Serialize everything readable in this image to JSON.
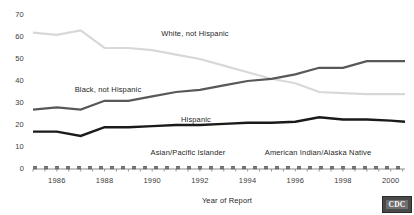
{
  "chart_data": {
    "type": "line",
    "title": "",
    "xlabel": "Year of Report",
    "ylabel": "",
    "xlim": [
      1985,
      2000.6
    ],
    "ylim": [
      0,
      70
    ],
    "grid": false,
    "legend_position": "inline-annotations",
    "x": [
      1985,
      1986,
      1987,
      1988,
      1989,
      1990,
      1991,
      1992,
      1993,
      1994,
      1995,
      1996,
      1997,
      1998,
      1999,
      2000,
      2000.6
    ],
    "x_tick_labels": [
      "1986",
      "1988",
      "1990",
      "1992",
      "1994",
      "1996",
      "1998",
      "2000"
    ],
    "x_tick_values": [
      1986,
      1988,
      1990,
      1992,
      1994,
      1996,
      1998,
      2000
    ],
    "y_tick_labels": [
      "0",
      "10",
      "20",
      "30",
      "40",
      "50",
      "60",
      "70"
    ],
    "y_tick_values": [
      0,
      10,
      20,
      30,
      40,
      50,
      60,
      70
    ],
    "series": [
      {
        "name": "White, not Hispanic",
        "color": "#d8d8d8",
        "style": "solid",
        "width": 2.2,
        "values": [
          62,
          61,
          63,
          55,
          55,
          54,
          52,
          50,
          47,
          44,
          41,
          39,
          35,
          34.5,
          34,
          34,
          34
        ]
      },
      {
        "name": "Black, not Hispanic",
        "color": "#585858",
        "style": "solid",
        "width": 2.2,
        "values": [
          27,
          28,
          27,
          31,
          31,
          33,
          35,
          36,
          38,
          40,
          41,
          43,
          46,
          46,
          49,
          49,
          49
        ]
      },
      {
        "name": "Hispanic",
        "color": "#1a1a1a",
        "style": "solid",
        "width": 2.4,
        "values": [
          17,
          17,
          15,
          19,
          19,
          19.5,
          20,
          20,
          20.5,
          21,
          21,
          21.5,
          23.5,
          22.5,
          22.5,
          22,
          21.5
        ]
      },
      {
        "name": "Asian/Pacific Islander",
        "color": "#6a6a6a",
        "style": "dashed",
        "width": 1.8,
        "values": [
          1,
          1,
          1,
          1,
          1,
          1,
          1,
          1,
          1,
          1,
          1,
          1,
          1,
          1,
          1,
          1,
          1
        ]
      },
      {
        "name": "American Indian/Alaska Native",
        "color": "#6a6a6a",
        "style": "dashed",
        "width": 1.8,
        "values": [
          0.3,
          0.3,
          0.3,
          0.3,
          0.3,
          0.3,
          0.3,
          0.3,
          0.3,
          0.3,
          0.3,
          0.3,
          0.3,
          0.3,
          0.3,
          0.3,
          0.3
        ]
      }
    ],
    "annotations": [
      {
        "text": "White, not Hispanic",
        "x_px": 195,
        "y_px": 29
      },
      {
        "text": "Black, not Hispanic",
        "x_px": 108,
        "y_px": 85
      },
      {
        "text": "Hispanic",
        "x_px": 196,
        "y_px": 115
      },
      {
        "text": "Asian/Pacific Islander",
        "x_px": 188,
        "y_px": 148
      },
      {
        "text": "American Indian/Alaska Native",
        "x_px": 318,
        "y_px": 148
      }
    ]
  },
  "logo": {
    "text": "CDC",
    "name": "cdc-logo"
  }
}
